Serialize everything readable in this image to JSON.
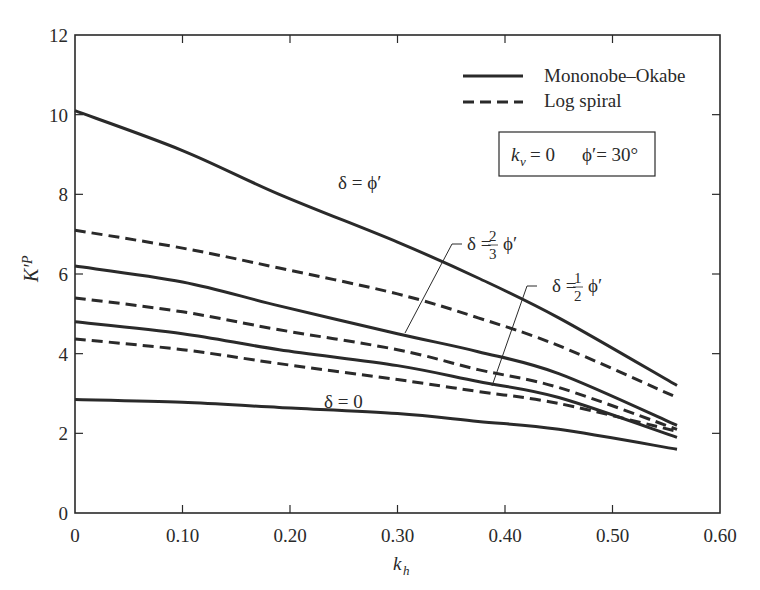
{
  "chart_data": {
    "type": "line",
    "title": "",
    "xlabel": "k_h",
    "ylabel": "K'_P",
    "xlim": [
      0,
      0.6
    ],
    "ylim": [
      0,
      12
    ],
    "xticks": [
      0,
      0.1,
      0.2,
      0.3,
      0.4,
      0.5,
      0.6
    ],
    "xtick_labels": [
      "0",
      "0.10",
      "0.20",
      "0.30",
      "0.40",
      "0.50",
      "0.60"
    ],
    "yticks": [
      0,
      2,
      4,
      6,
      8,
      10,
      12
    ],
    "ytick_labels": [
      "0",
      "2",
      "4",
      "6",
      "8",
      "10",
      "12"
    ],
    "grid": false,
    "legend": {
      "position": "upper right",
      "entries": [
        {
          "label": "Mononobe–Okabe",
          "style": "solid"
        },
        {
          "label": "Log spiral",
          "style": "dashed"
        }
      ]
    },
    "parameter_box": {
      "kv_label": "k",
      "kv_sub": "v",
      "kv_value": "= 0",
      "phi_text": "ϕ′= 30°"
    },
    "x": [
      0,
      0.1,
      0.19,
      0.3,
      0.375,
      0.45,
      0.56
    ],
    "series": [
      {
        "name": "Mononobe–Okabe, δ = ϕ′",
        "style": "solid",
        "values": [
          10.1,
          9.1,
          8.0,
          6.8,
          5.9,
          4.9,
          3.2
        ]
      },
      {
        "name": "Log spiral, δ = ϕ′",
        "style": "dashed",
        "values": [
          7.1,
          6.65,
          6.15,
          5.5,
          4.9,
          4.2,
          2.9
        ]
      },
      {
        "name": "Mononobe–Okabe, δ = 2/3 ϕ′",
        "style": "solid",
        "values": [
          6.2,
          5.8,
          5.2,
          4.5,
          4.05,
          3.5,
          2.2
        ]
      },
      {
        "name": "Log spiral, δ = 2/3 ϕ′",
        "style": "dashed",
        "values": [
          5.4,
          5.05,
          4.6,
          4.1,
          3.6,
          3.15,
          2.1
        ]
      },
      {
        "name": "Mononobe–Okabe, δ = 1/2 ϕ′",
        "style": "solid",
        "values": [
          4.8,
          4.5,
          4.1,
          3.7,
          3.3,
          2.9,
          1.9
        ]
      },
      {
        "name": "Log spiral, δ = 1/2 ϕ′",
        "style": "dashed",
        "values": [
          4.37,
          4.1,
          3.75,
          3.35,
          3.05,
          2.75,
          2.05
        ]
      },
      {
        "name": "Mononobe–Okabe, δ = 0",
        "style": "solid",
        "values": [
          2.85,
          2.78,
          2.65,
          2.5,
          2.3,
          2.1,
          1.6
        ]
      }
    ],
    "annotations": [
      {
        "text": "δ = ϕ′",
        "x": 0.245,
        "y": 8.2
      },
      {
        "text": "δ = 2/3 ϕ′",
        "x": 0.35,
        "y": 6.7
      },
      {
        "text": "δ = 1/2 ϕ′",
        "x": 0.42,
        "y": 5.7
      },
      {
        "text": "δ = 0",
        "x": 0.24,
        "y": 2.9
      }
    ]
  },
  "labels": {
    "delta_phi": "δ = ϕ′",
    "delta_two_thirds_prefix": "δ =",
    "delta_two_thirds_num": "2",
    "delta_two_thirds_den": "3",
    "delta_half_prefix": "δ =",
    "delta_half_num": "1",
    "delta_half_den": "2",
    "phi_prime": "ϕ′",
    "delta_zero": "δ = 0",
    "ylabel_main": "K′",
    "ylabel_sub": "P",
    "xlabel_main": "k",
    "xlabel_sub": "h"
  }
}
